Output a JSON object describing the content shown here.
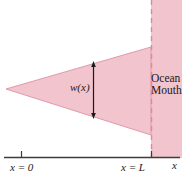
{
  "figure": {
    "colors": {
      "water_fill": "#f2c4cd",
      "water_edge": "#e09aab",
      "axis": "#3c3c3c",
      "arrow": "#1a1a1a",
      "background": "#ffffff"
    },
    "regions": {
      "estuary": {
        "name": "estuary-wedge",
        "apex": {
          "x": 6,
          "y": 89
        },
        "top_right": {
          "x": 151,
          "y": 47
        },
        "bottom_right": {
          "x": 151,
          "y": 135
        }
      },
      "ocean": {
        "name": "ocean-band",
        "left": 151,
        "right": 182,
        "top": 0,
        "bottom": 158
      }
    },
    "mouth_line": {
      "x": 151,
      "y_top": 0,
      "y_bottom": 158,
      "style": "dashed"
    },
    "width_arrow": {
      "x": 93,
      "y_top": 62,
      "y_bottom": 118,
      "double_headed": true
    },
    "axis": {
      "y": 157,
      "x_start": 4,
      "x_end": 180,
      "ticks": [
        {
          "x": 21,
          "label": "x = 0"
        },
        {
          "x": 151,
          "label": "x = L"
        }
      ]
    }
  },
  "labels": {
    "width_function": "w(x)",
    "x_zero": "x = 0",
    "x_ell": "x = L",
    "x_axis": "x",
    "ocean": "Ocean",
    "mouth": "Mouth"
  }
}
